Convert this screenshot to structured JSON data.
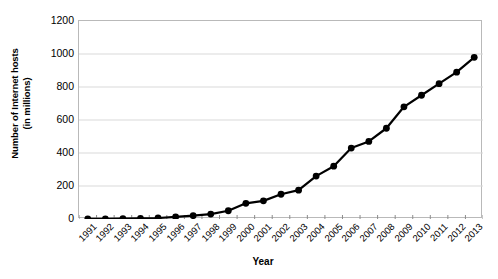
{
  "chart_data": {
    "type": "line",
    "title": "",
    "xlabel": "Year",
    "ylabel": "Number of Internet hosts\n(in millions)",
    "ylabel_line1": "Number of Internet hosts",
    "ylabel_line2": "(in millions)",
    "categories": [
      "1991",
      "1992",
      "1993",
      "1994",
      "1995",
      "1996",
      "1997",
      "1998",
      "1999",
      "2000",
      "2001",
      "2002",
      "2003",
      "2004",
      "2005",
      "2006",
      "2007",
      "2008",
      "2009",
      "2010",
      "2011",
      "2012",
      "2013"
    ],
    "values": [
      0.6,
      1,
      2,
      4,
      6,
      13,
      20,
      30,
      50,
      95,
      110,
      150,
      175,
      260,
      320,
      430,
      470,
      550,
      680,
      750,
      820,
      890,
      980
    ],
    "series": [
      {
        "name": "Number of Internet hosts (in millions)",
        "values": [
          0.6,
          1,
          2,
          4,
          6,
          13,
          20,
          30,
          50,
          95,
          110,
          150,
          175,
          260,
          320,
          430,
          470,
          550,
          680,
          750,
          820,
          890,
          980
        ]
      }
    ],
    "ylim": [
      0,
      1200
    ],
    "yticks": [
      0,
      200,
      400,
      600,
      800,
      1000,
      1200
    ],
    "ytick_labels": [
      "0",
      "200",
      "400",
      "600",
      "800",
      "1000",
      "1200"
    ],
    "grid": true,
    "grid_axis": "y",
    "legend": false,
    "legend_position": "none",
    "marker": "circle",
    "line_color": "#000000",
    "marker_color": "#000000",
    "grid_color": "#d9d9d9",
    "axis_color": "#b9b9b9",
    "background_color": "#ffffff"
  }
}
